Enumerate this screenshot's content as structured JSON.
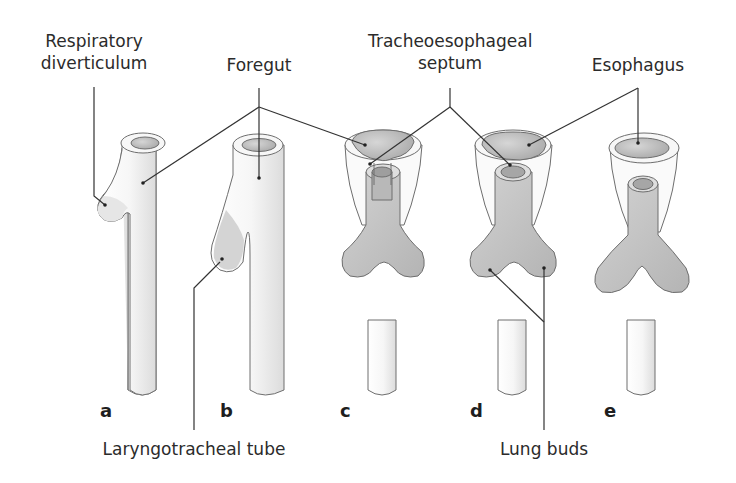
{
  "figure": {
    "type": "anatomical-development-diagram",
    "colors": {
      "tube_fill": "#f4f4f4",
      "tube_outline": "#6e6e6e",
      "lumen_fill": "#bdbdbd",
      "bud_fill": "#c6c6c6",
      "leader_line": "#333333",
      "text": "#2b2b2b"
    }
  },
  "labels": {
    "respiratory_diverticulum": [
      "Respiratory",
      "diverticulum"
    ],
    "foregut": "Foregut",
    "tracheoesophageal_septum": [
      "Tracheoesophageal",
      "septum"
    ],
    "esophagus": "Esophagus",
    "laryngotracheal_tube": "Laryngotracheal tube",
    "lung_buds": "Lung buds"
  },
  "stages": [
    {
      "id": "a",
      "label": "a"
    },
    {
      "id": "b",
      "label": "b"
    },
    {
      "id": "c",
      "label": "c"
    },
    {
      "id": "d",
      "label": "d"
    },
    {
      "id": "e",
      "label": "e"
    }
  ]
}
